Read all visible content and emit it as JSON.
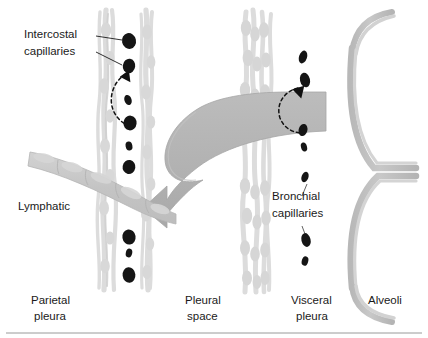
{
  "figure": {
    "width": 428,
    "height": 338
  },
  "colors": {
    "background": "#ffffff",
    "big_arrow": "#b4b4b4",
    "big_arrow_edge": "#a0a0a0",
    "membrane_fiber": "#dcdcdc",
    "membrane_fiber_dark": "#cfcfcf",
    "lymphatic": "#c9c9c9",
    "lymphatic_edge": "#b5b5b5",
    "alveoli_wall": "#c2c2c2",
    "alveoli_wall_edge": "#aaaaaa",
    "capillary_blob": "#151515",
    "text": "#1a1a1a",
    "leader_line": "#1a1a1a",
    "dashed_arrow": "#111111",
    "bottom_rule": "#9a9a9a"
  },
  "labels": {
    "intercostal_capillaries": {
      "line1": "Intercostal",
      "line2": "capillaries"
    },
    "lymphatic": "Lymphatic",
    "bronchial_capillaries": {
      "line1": "Bronchial",
      "line2": "capillaries"
    }
  },
  "bottom_labels": [
    {
      "id": "parietal-pleura",
      "line1": "Parietal",
      "line2": "pleura"
    },
    {
      "id": "pleural-space",
      "line1": "Pleural",
      "line2": "space"
    },
    {
      "id": "visceral-pleura",
      "line1": "Visceral",
      "line2": "pleura"
    },
    {
      "id": "alveoli",
      "line1": "Alveoli",
      "line2": ""
    }
  ],
  "structures": {
    "parietal_pleura": "two wavy light-gray fiber strands forming the parietal pleural membrane",
    "visceral_pleura": "braided light-gray fiber strands forming the visceral pleural membrane",
    "pleural_space": "clear white gap between parietal and visceral pleura",
    "lymphatic": "gray beaded vessel sloping from left edge down toward the parietal pleura",
    "alveoli": "two large C-shaped alveolar walls opening rightward with partial curves above and below",
    "big_arrow": "large curved gray arrow sweeping from the visceral pleura leftward into the lymphatic"
  },
  "capillaries": {
    "intercostal": [
      {
        "cx": 129,
        "cy": 41,
        "rx": 7.0,
        "ry": 8.0,
        "rot": -12
      },
      {
        "cx": 129,
        "cy": 66,
        "rx": 6.2,
        "ry": 7.2,
        "rot": 8
      },
      {
        "cx": 128,
        "cy": 100,
        "rx": 3.6,
        "ry": 5.2,
        "rot": -18
      },
      {
        "cx": 130,
        "cy": 123,
        "rx": 6.6,
        "ry": 7.4,
        "rot": 6
      },
      {
        "cx": 129,
        "cy": 146,
        "rx": 3.4,
        "ry": 4.6,
        "rot": -10
      },
      {
        "cx": 129,
        "cy": 167,
        "rx": 6.4,
        "ry": 7.0,
        "rot": 10
      },
      {
        "cx": 129,
        "cy": 237,
        "rx": 6.6,
        "ry": 7.6,
        "rot": -8
      },
      {
        "cx": 129,
        "cy": 253,
        "rx": 3.2,
        "ry": 4.4,
        "rot": 14
      },
      {
        "cx": 129,
        "cy": 275,
        "rx": 6.4,
        "ry": 7.8,
        "rot": -6
      }
    ],
    "bronchial": [
      {
        "cx": 303,
        "cy": 57,
        "rx": 4.0,
        "ry": 6.6,
        "rot": 18
      },
      {
        "cx": 305,
        "cy": 80,
        "rx": 5.0,
        "ry": 7.4,
        "rot": -12
      },
      {
        "cx": 303,
        "cy": 130,
        "rx": 4.4,
        "ry": 6.2,
        "rot": 14
      },
      {
        "cx": 304,
        "cy": 147,
        "rx": 3.0,
        "ry": 4.6,
        "rot": -16
      },
      {
        "cx": 305,
        "cy": 177,
        "rx": 3.4,
        "ry": 5.4,
        "rot": 20
      },
      {
        "cx": 306,
        "cy": 240,
        "rx": 4.6,
        "ry": 7.0,
        "rot": -14
      },
      {
        "cx": 305,
        "cy": 261,
        "rx": 3.2,
        "ry": 4.8,
        "rot": 16
      }
    ]
  }
}
